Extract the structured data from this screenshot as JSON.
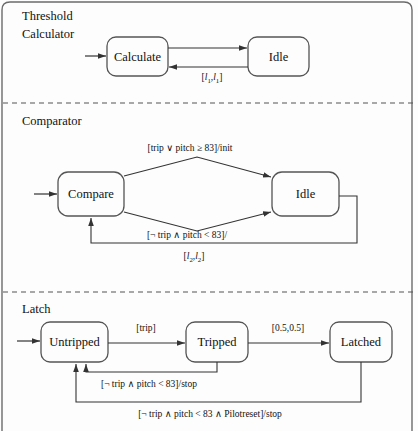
{
  "diagram": {
    "type": "statechart",
    "title_regions": [
      "Threshold Calculator",
      "Comparator",
      "Latch"
    ],
    "regions": [
      {
        "id": "threshold-calculator",
        "name_line1": "Threshold",
        "name_line2": "Calculator",
        "states": [
          {
            "id": "calculate",
            "label": "Calculate"
          },
          {
            "id": "idle1",
            "label": "Idle"
          }
        ],
        "transitions": [
          {
            "id": "calc-to-idle",
            "from": "calculate",
            "to": "idle1",
            "label": ""
          },
          {
            "id": "idle-to-calc",
            "from": "idle1",
            "to": "calculate",
            "label": "[l1,l1]"
          }
        ]
      },
      {
        "id": "comparator",
        "name_line1": "Comparator",
        "name_line2": "",
        "states": [
          {
            "id": "compare",
            "label": "Compare"
          },
          {
            "id": "idle2",
            "label": "Idle"
          }
        ],
        "transitions": [
          {
            "id": "compare-to-idle-top",
            "from": "compare",
            "to": "idle2",
            "label": "[trip ∨ pitch ≥ 83]/init"
          },
          {
            "id": "compare-to-idle-bottom",
            "from": "compare",
            "to": "idle2",
            "label": "[¬ trip ∧ pitch < 83]/"
          },
          {
            "id": "idle-to-compare-loop",
            "from": "idle2",
            "to": "compare",
            "label": "[l2,l2]"
          }
        ]
      },
      {
        "id": "latch",
        "name_line1": "Latch",
        "name_line2": "",
        "states": [
          {
            "id": "untripped",
            "label": "Untripped"
          },
          {
            "id": "tripped",
            "label": "Tripped"
          },
          {
            "id": "latched",
            "label": "Latched"
          }
        ],
        "transitions": [
          {
            "id": "untripped-to-tripped",
            "from": "untripped",
            "to": "tripped",
            "label": "[trip]"
          },
          {
            "id": "tripped-to-latched",
            "from": "tripped",
            "to": "latched",
            "label": "[0.5,0.5]"
          },
          {
            "id": "tripped-to-untripped",
            "from": "tripped",
            "to": "untripped",
            "label": "[¬ trip ∧ pitch < 83]/stop"
          },
          {
            "id": "latched-to-untripped",
            "from": "latched",
            "to": "untripped",
            "label": "[¬ trip ∧ pitch < 83 ∧ Pilotreset]/stop"
          }
        ]
      }
    ],
    "labels": {
      "threshold_title_l1": "Threshold",
      "threshold_title_l2": "Calculator",
      "comparator_title": "Comparator",
      "latch_title": "Latch",
      "calculate": "Calculate",
      "idle_1": "Idle",
      "compare": "Compare",
      "idle_2": "Idle",
      "untripped": "Untripped",
      "tripped": "Tripped",
      "latched": "Latched",
      "t_idle_to_calc_pre": "[",
      "t_idle_to_calc_i": "l",
      "t_idle_to_calc_sub": "1",
      "t_comp_top": "[trip ∨ pitch ≥ 83]/init",
      "t_comp_bottom": "[¬ trip ∧ pitch < 83]/",
      "t_comp_loop_i": "l",
      "t_comp_loop_sub": "2",
      "t_latch_trip": "[trip]",
      "t_latch_05": "[0.5,0.5]",
      "t_latch_stop": "[¬ trip ∧ pitch < 83]/stop",
      "t_latch_pilotreset": "[¬ trip ∧ pitch < 83 ∧ Pilotreset]/stop"
    },
    "colors": {
      "stroke": "#3a3a3a",
      "text": "#111111",
      "background": "#fdfdfd",
      "divider": "#555555"
    }
  }
}
